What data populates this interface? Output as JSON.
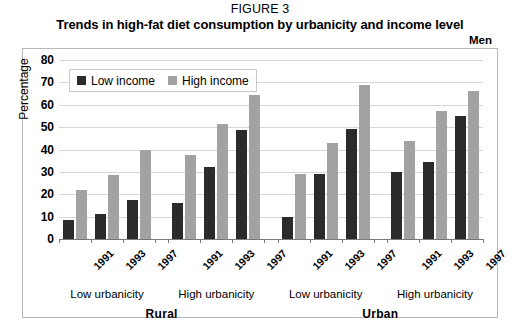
{
  "header": {
    "figure_number": "FIGURE 3",
    "title": "Trends in high-fat diet consumption by urbanicity and income level",
    "sex_label": "Men"
  },
  "legend": {
    "items": [
      {
        "label": "Low income",
        "color": "#2b2b2b"
      },
      {
        "label": "High income",
        "color": "#a2a2a2"
      }
    ]
  },
  "chart_data": {
    "type": "bar",
    "title": "Trends in high-fat diet consumption by urbanicity and income level",
    "subtitle": "Men",
    "xlabel": "",
    "ylabel": "Percentage",
    "ylim": [
      0,
      80
    ],
    "yticks": [
      0,
      10,
      20,
      30,
      40,
      50,
      60,
      70,
      80
    ],
    "ytick_labels": [
      "0",
      "10",
      "20",
      "30",
      "40",
      "50",
      "60",
      "70",
      "80"
    ],
    "grid": true,
    "legend_position": "top-left",
    "categories": [
      "1991",
      "1993",
      "1997",
      "1991",
      "1993",
      "1997",
      "1991",
      "1993",
      "1997",
      "1991",
      "1993",
      "1997"
    ],
    "series": [
      {
        "name": "Low income",
        "color": "#2b2b2b",
        "values": [
          8.5,
          11,
          17.5,
          16,
          32,
          48.5,
          10,
          29,
          49,
          30,
          34.5,
          55
        ]
      },
      {
        "name": "High income",
        "color": "#a2a2a2",
        "values": [
          22,
          28.5,
          40,
          37.5,
          51.5,
          64.5,
          29,
          43,
          69,
          44,
          57,
          66
        ]
      }
    ],
    "groups": [
      {
        "urbanicity": "Low urbanicity",
        "area": "Rural",
        "years": [
          "1991",
          "1993",
          "1997"
        ]
      },
      {
        "urbanicity": "High urbanicity",
        "area": "Rural",
        "years": [
          "1991",
          "1993",
          "1997"
        ]
      },
      {
        "urbanicity": "Low urbanicity",
        "area": "Urban",
        "years": [
          "1991",
          "1993",
          "1997"
        ]
      },
      {
        "urbanicity": "High urbanicity",
        "area": "Urban",
        "years": [
          "1991",
          "1993",
          "1997"
        ]
      }
    ],
    "area_labels": [
      "Rural",
      "Urban"
    ],
    "urbanicity_labels": [
      "Low urbanicity",
      "High urbanicity",
      "Low urbanicity",
      "High urbanicity"
    ],
    "year_labels": [
      "1991",
      "1993",
      "1997",
      "1991",
      "1993",
      "1997",
      "1991",
      "1993",
      "1997",
      "1991",
      "1993",
      "1997"
    ]
  }
}
